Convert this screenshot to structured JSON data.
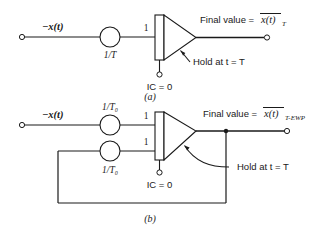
{
  "figure": {
    "background_color": "#ffffff",
    "line_color": "#1a1a1a"
  },
  "diagram_a": {
    "caption": "(a)",
    "input_label": "−x(t)",
    "gain_label": "1/T",
    "integrator_input_gain": "1",
    "ic_label": "IC = 0",
    "hold_label": "Hold at t = T",
    "output_prefix": "Final value =",
    "output_expression": "x(t)",
    "output_subscript": "T",
    "output_overline": true
  },
  "diagram_b": {
    "caption": "(b)",
    "input_label": "−x(t)",
    "gain_label_top": "1/T₀",
    "gain_label_bottom": "1/T₀",
    "integrator_input_gain_top": "1",
    "integrator_input_gain_bottom": "1",
    "ic_label": "IC = 0",
    "hold_label": "Hold at t = T",
    "output_prefix": "Final value =",
    "output_expression": "x(t)",
    "output_subscript": "T-EWP",
    "output_overline": true,
    "has_feedback_loop": true
  }
}
